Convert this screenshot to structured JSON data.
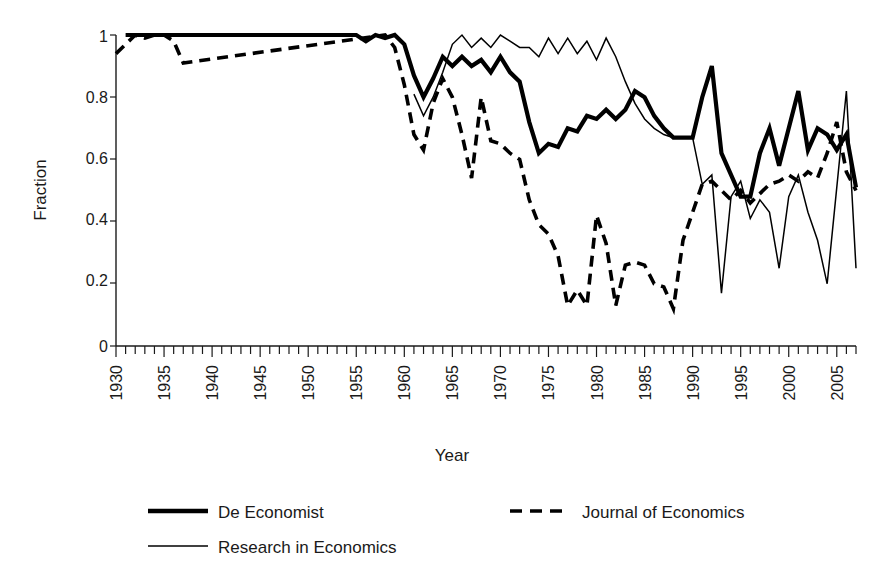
{
  "chart_data": {
    "type": "line",
    "title": "",
    "xlabel": "Year",
    "ylabel": "Fraction",
    "xlim": [
      1930,
      2007
    ],
    "ylim": [
      0,
      1
    ],
    "grid": false,
    "legend_position": "bottom",
    "y_ticks": [
      "0",
      "0.2",
      "0.4",
      "0.6",
      "0.8",
      "1"
    ],
    "y_tick_values": [
      0,
      0.2,
      0.4,
      0.6,
      0.8,
      1
    ],
    "x_ticks": [
      "1930",
      "1935",
      "1940",
      "1945",
      "1950",
      "1955",
      "1960",
      "1965",
      "1970",
      "1975",
      "1980",
      "1985",
      "1990",
      "1995",
      "2000",
      "2005"
    ],
    "x_tick_values": [
      1930,
      1935,
      1940,
      1945,
      1950,
      1955,
      1960,
      1965,
      1970,
      1975,
      1980,
      1985,
      1990,
      1995,
      2000,
      2005
    ],
    "x_minor_step": 1,
    "series": [
      {
        "name": "De Economist",
        "style": "thick-solid",
        "color": "#000000",
        "x": [
          1931,
          1932,
          1933,
          1934,
          1935,
          1936,
          1937,
          1938,
          1939,
          1940,
          1941,
          1942,
          1943,
          1944,
          1945,
          1946,
          1947,
          1948,
          1949,
          1950,
          1951,
          1952,
          1953,
          1954,
          1955,
          1956,
          1957,
          1958,
          1959,
          1960,
          1961,
          1962,
          1963,
          1964,
          1965,
          1966,
          1967,
          1968,
          1969,
          1970,
          1971,
          1972,
          1973,
          1974,
          1975,
          1976,
          1977,
          1978,
          1979,
          1980,
          1981,
          1982,
          1983,
          1984,
          1985,
          1986,
          1987,
          1988,
          1989,
          1990,
          1991,
          1992,
          1993,
          1994,
          1995,
          1996,
          1997,
          1998,
          1999,
          2000,
          2001,
          2002,
          2003,
          2004,
          2005,
          2006,
          2007
        ],
        "y": [
          1.0,
          1.0,
          1.0,
          1.0,
          1.0,
          1.0,
          1.0,
          1.0,
          1.0,
          1.0,
          1.0,
          1.0,
          1.0,
          1.0,
          1.0,
          1.0,
          1.0,
          1.0,
          1.0,
          1.0,
          1.0,
          1.0,
          1.0,
          1.0,
          1.0,
          0.98,
          1.0,
          0.99,
          1.0,
          0.97,
          0.87,
          0.8,
          0.86,
          0.93,
          0.9,
          0.93,
          0.9,
          0.92,
          0.88,
          0.93,
          0.88,
          0.85,
          0.72,
          0.62,
          0.65,
          0.64,
          0.7,
          0.69,
          0.74,
          0.73,
          0.76,
          0.73,
          0.76,
          0.82,
          0.8,
          0.74,
          0.7,
          0.67,
          0.67,
          0.67,
          0.8,
          0.9,
          0.62,
          0.55,
          0.48,
          0.48,
          0.62,
          0.7,
          0.58,
          0.7,
          0.82,
          0.63,
          0.7,
          0.68,
          0.63,
          0.68,
          0.51
        ]
      },
      {
        "name": "Journal of Economics",
        "style": "dashed",
        "color": "#000000",
        "x": [
          1930,
          1931,
          1932,
          1933,
          1934,
          1935,
          1936,
          1937,
          1958,
          1959,
          1960,
          1961,
          1962,
          1963,
          1964,
          1965,
          1966,
          1967,
          1968,
          1969,
          1970,
          1971,
          1972,
          1973,
          1974,
          1975,
          1976,
          1977,
          1978,
          1979,
          1980,
          1981,
          1982,
          1983,
          1984,
          1985,
          1986,
          1987,
          1988,
          1989,
          1990,
          1991,
          1992,
          1993,
          1994,
          1995,
          1996,
          1997,
          1998,
          1999,
          2000,
          2001,
          2002,
          2003,
          2004,
          2005,
          2006,
          2007
        ],
        "y": [
          0.94,
          0.97,
          1.0,
          0.99,
          1.0,
          1.0,
          0.98,
          0.91,
          1.0,
          0.96,
          0.84,
          0.68,
          0.63,
          0.78,
          0.86,
          0.8,
          0.68,
          0.54,
          0.8,
          0.66,
          0.65,
          0.62,
          0.6,
          0.47,
          0.39,
          0.36,
          0.29,
          0.13,
          0.18,
          0.13,
          0.42,
          0.33,
          0.13,
          0.26,
          0.27,
          0.26,
          0.2,
          0.19,
          0.12,
          0.34,
          0.43,
          0.52,
          0.53,
          0.5,
          0.47,
          0.5,
          0.46,
          0.49,
          0.52,
          0.53,
          0.55,
          0.53,
          0.56,
          0.54,
          0.62,
          0.72,
          0.56,
          0.5
        ]
      },
      {
        "name": "Research in Economics",
        "style": "thin-solid",
        "color": "#000000",
        "x": [
          1961,
          1962,
          1963,
          1964,
          1965,
          1966,
          1967,
          1968,
          1969,
          1970,
          1971,
          1972,
          1973,
          1974,
          1975,
          1976,
          1977,
          1978,
          1979,
          1980,
          1981,
          1982,
          1983,
          1984,
          1985,
          1986,
          1987,
          1988,
          1989,
          1990,
          1991,
          1992,
          1993,
          1994,
          1995,
          1996,
          1997,
          1998,
          1999,
          2000,
          2001,
          2002,
          2003,
          2004,
          2005,
          2006,
          2007
        ],
        "y": [
          0.81,
          0.74,
          0.8,
          0.88,
          0.97,
          1.0,
          0.96,
          0.99,
          0.96,
          1.0,
          0.98,
          0.96,
          0.96,
          0.93,
          0.99,
          0.94,
          0.99,
          0.94,
          0.98,
          0.92,
          0.99,
          0.93,
          0.85,
          0.78,
          0.73,
          0.7,
          0.68,
          0.67,
          0.67,
          0.67,
          0.52,
          0.55,
          0.17,
          0.48,
          0.53,
          0.41,
          0.47,
          0.43,
          0.25,
          0.48,
          0.55,
          0.43,
          0.34,
          0.2,
          0.51,
          0.82,
          0.25
        ]
      }
    ]
  },
  "legend": {
    "items": [
      {
        "label": "De Economist",
        "style": "thick-solid"
      },
      {
        "label": "Journal of Economics",
        "style": "dashed"
      },
      {
        "label": "Research in Economics",
        "style": "thin-solid"
      }
    ]
  }
}
